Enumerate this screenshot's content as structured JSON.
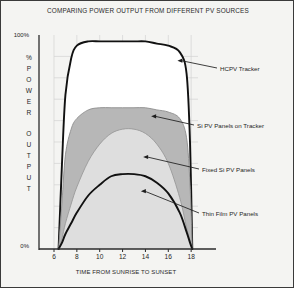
{
  "chart_data": {
    "type": "area",
    "title": "COMPARING POWER OUTPUT FROM DIFFERENT PV SOURCES",
    "xlabel": "TIME FROM SUNRISE TO SUNSET",
    "ylabel": "% POWER OUTPUT",
    "ylabel_letters": [
      "%",
      "P",
      "O",
      "W",
      "E",
      "R",
      "",
      "O",
      "U",
      "T",
      "P",
      "U",
      "T"
    ],
    "xlim": [
      6,
      18.6
    ],
    "ylim": [
      0,
      100
    ],
    "xticks": [
      6,
      8,
      10,
      12,
      14,
      16,
      18
    ],
    "xtick_labels": [
      "6",
      "8",
      "10",
      "12",
      "14",
      "16",
      "18"
    ],
    "yticks": [
      0,
      100
    ],
    "ytick_labels": [
      "0%",
      "100%"
    ],
    "grid": true,
    "legend_position": "right-annotations",
    "x": [
      6.4,
      6.7,
      7.0,
      7.5,
      8.0,
      9.0,
      10.0,
      11.0,
      12.0,
      13.0,
      14.0,
      15.0,
      16.0,
      17.0,
      17.6,
      17.9,
      18.1
    ],
    "series": [
      {
        "name": "HCPV Tracker",
        "style": "line",
        "color": "#111111",
        "fill": "#ffffff",
        "peak": 97,
        "values": [
          0,
          40,
          72,
          89,
          95,
          97,
          97,
          97,
          97,
          97,
          97,
          96,
          95,
          92,
          82,
          50,
          0
        ]
      },
      {
        "name": "Si PV Panels on Tracker",
        "style": "area",
        "color": "#8d8d8d",
        "fill": "#b7b7b7",
        "peak": 66,
        "values": [
          0,
          22,
          44,
          56,
          61,
          65,
          66,
          66,
          66,
          66,
          66,
          65,
          64,
          61,
          52,
          30,
          0
        ]
      },
      {
        "name": "Fixed Si PV Panels",
        "style": "area",
        "color": "#9a9a9a",
        "fill": "#dedede",
        "peak": 56,
        "values": [
          0,
          5,
          12,
          21,
          29,
          41,
          49,
          54,
          56,
          56,
          54,
          49,
          40,
          24,
          10,
          4,
          0
        ]
      },
      {
        "name": "Thin Film PV Panels",
        "style": "line",
        "color": "#111111",
        "fill": "none",
        "peak": 35,
        "values": [
          0,
          3,
          7,
          12,
          17,
          25,
          30,
          34,
          35,
          35,
          34,
          31,
          26,
          17,
          8,
          3,
          0
        ]
      }
    ],
    "annotations": [
      {
        "label": "HCPV Tracker",
        "target_x": 16.8,
        "target_y": 88
      },
      {
        "label": "Si PV Panels on Tracker",
        "target_x": 14.5,
        "target_y": 62
      },
      {
        "label": "Fixed Si PV Panels",
        "target_x": 13.8,
        "target_y": 43
      },
      {
        "label": "Thin Film PV Panels",
        "target_x": 13.6,
        "target_y": 27
      }
    ]
  },
  "colors": {
    "background": "#f4f4f2",
    "border": "#3a3a3a",
    "axis": "#2b2b2b",
    "grid": "#d2d2d2",
    "line_dark": "#111111",
    "fill_mid_gray": "#b7b7b7",
    "fill_light_gray": "#dedede",
    "fill_white": "#ffffff"
  }
}
